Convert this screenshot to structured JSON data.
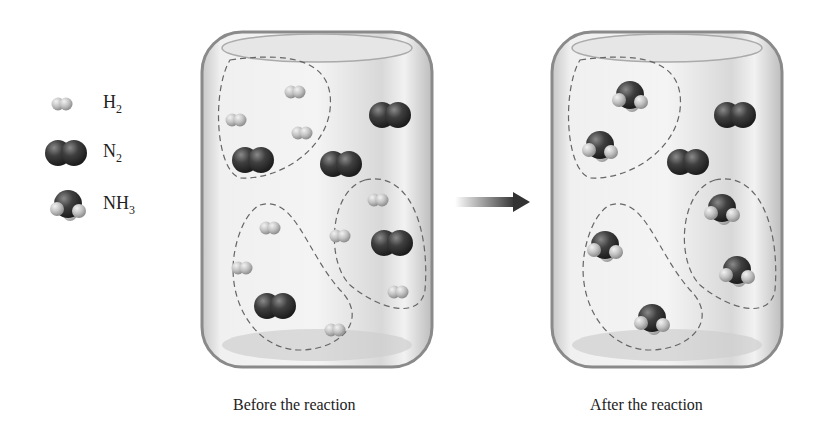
{
  "legend": {
    "items": [
      {
        "id": "h2",
        "base": "H",
        "sub": "2"
      },
      {
        "id": "n2",
        "base": "N",
        "sub": "2"
      },
      {
        "id": "nh3",
        "base": "NH",
        "sub": "3"
      }
    ]
  },
  "containers": [
    {
      "id": "before",
      "caption": "Before the reaction",
      "molecules": {
        "H2": 9,
        "N2": 4
      }
    },
    {
      "id": "after",
      "caption": "After the reaction",
      "molecules": {
        "NH3": 6,
        "N2": 2
      }
    }
  ],
  "arrow": {
    "direction": "right"
  },
  "colors": {
    "nitrogen": "#3a3a3a",
    "hydrogen": "#bdbdbd",
    "dashed": "#666666",
    "glass": "#e9e9e9"
  }
}
